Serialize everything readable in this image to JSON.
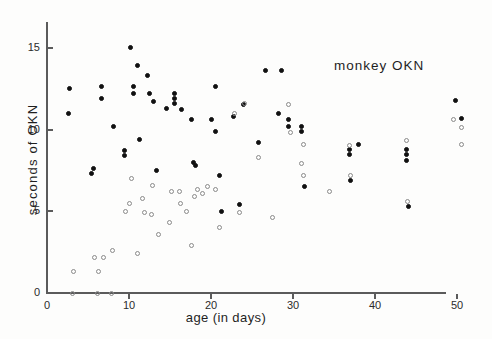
{
  "chart_data": {
    "type": "scatter",
    "title": "monkey OKN",
    "xlabel": "age (in days)",
    "ylabel": "seconds of OKN",
    "xlim": [
      0,
      54
    ],
    "ylim": [
      0,
      16.6
    ],
    "grid": false,
    "legend_position": "none",
    "xticks": [
      0,
      10,
      20,
      30,
      40,
      50
    ],
    "xtick_labels": [
      "0",
      "10",
      "20",
      "30",
      "40",
      "50"
    ],
    "yticks": [
      0,
      5,
      10,
      15
    ],
    "ytick_labels": [
      "0",
      "5",
      "10",
      "15"
    ],
    "series": [
      {
        "name": "filled",
        "marker": "filled-circle",
        "color": "#111111",
        "points": [
          [
            2.7,
            12.5
          ],
          [
            2.6,
            11.0
          ],
          [
            5.4,
            7.3
          ],
          [
            6.6,
            12.6
          ],
          [
            6.6,
            11.9
          ],
          [
            5.7,
            7.6
          ],
          [
            8.1,
            10.2
          ],
          [
            9.5,
            8.7
          ],
          [
            9.5,
            8.4
          ],
          [
            10.2,
            15.0
          ],
          [
            10.5,
            12.6
          ],
          [
            10.5,
            12.2
          ],
          [
            11.3,
            9.4
          ],
          [
            11.0,
            13.9
          ],
          [
            12.3,
            13.3
          ],
          [
            12.5,
            12.2
          ],
          [
            13.0,
            11.7
          ],
          [
            13.4,
            7.5
          ],
          [
            14.6,
            11.3
          ],
          [
            15.6,
            12.2
          ],
          [
            15.6,
            11.9
          ],
          [
            15.6,
            11.6
          ],
          [
            16.4,
            11.2
          ],
          [
            17.6,
            10.6
          ],
          [
            18.1,
            7.8
          ],
          [
            17.9,
            8.0
          ],
          [
            20.5,
            12.6
          ],
          [
            21.0,
            7.2
          ],
          [
            21.3,
            5.0
          ],
          [
            20.0,
            10.6
          ],
          [
            20.5,
            9.9
          ],
          [
            22.8,
            10.8
          ],
          [
            23.5,
            5.4
          ],
          [
            24.0,
            11.5
          ],
          [
            25.8,
            9.2
          ],
          [
            26.6,
            13.6
          ],
          [
            28.6,
            13.6
          ],
          [
            28.2,
            11.0
          ],
          [
            29.5,
            10.6
          ],
          [
            29.5,
            10.2
          ],
          [
            31.0,
            10.2
          ],
          [
            31.0,
            9.9
          ],
          [
            31.4,
            6.5
          ],
          [
            36.9,
            8.8
          ],
          [
            36.9,
            8.5
          ],
          [
            37.0,
            6.9
          ],
          [
            38.0,
            9.1
          ],
          [
            43.9,
            8.8
          ],
          [
            43.9,
            8.5
          ],
          [
            43.9,
            8.1
          ],
          [
            44.1,
            5.3
          ],
          [
            49.8,
            11.8
          ],
          [
            50.6,
            10.7
          ]
        ]
      },
      {
        "name": "open",
        "marker": "open-circle",
        "color": "#8a8a8a",
        "points": [
          [
            3.1,
            0.0
          ],
          [
            3.2,
            1.3
          ],
          [
            6.1,
            0.0
          ],
          [
            6.3,
            1.3
          ],
          [
            7.9,
            0.0
          ],
          [
            5.8,
            2.2
          ],
          [
            6.9,
            2.2
          ],
          [
            8.0,
            2.6
          ],
          [
            9.6,
            5.0
          ],
          [
            10.0,
            5.5
          ],
          [
            10.3,
            7.0
          ],
          [
            11.0,
            2.4
          ],
          [
            11.6,
            5.8
          ],
          [
            11.9,
            4.9
          ],
          [
            12.7,
            4.8
          ],
          [
            12.9,
            6.6
          ],
          [
            13.6,
            3.6
          ],
          [
            14.9,
            4.3
          ],
          [
            15.2,
            6.2
          ],
          [
            16.1,
            6.2
          ],
          [
            16.3,
            5.5
          ],
          [
            17.0,
            5.0
          ],
          [
            17.6,
            2.9
          ],
          [
            18.4,
            6.3
          ],
          [
            18.0,
            5.9
          ],
          [
            19.0,
            6.1
          ],
          [
            19.6,
            6.5
          ],
          [
            20.6,
            6.3
          ],
          [
            21.0,
            4.0
          ],
          [
            23.5,
            4.9
          ],
          [
            22.9,
            11.0
          ],
          [
            24.1,
            11.6
          ],
          [
            25.8,
            8.3
          ],
          [
            27.5,
            4.6
          ],
          [
            29.4,
            11.5
          ],
          [
            29.7,
            9.8
          ],
          [
            31.3,
            9.1
          ],
          [
            31.0,
            7.9
          ],
          [
            31.3,
            7.2
          ],
          [
            34.5,
            6.2
          ],
          [
            36.9,
            9.0
          ],
          [
            37.0,
            7.2
          ],
          [
            43.9,
            9.3
          ],
          [
            44.0,
            5.6
          ],
          [
            49.6,
            10.6
          ],
          [
            50.5,
            9.1
          ],
          [
            50.6,
            10.1
          ]
        ]
      }
    ]
  },
  "axes": {
    "y_title": "seconds of OKN",
    "x_title": "age (in days)"
  },
  "annotation": {
    "text": "monkey OKN"
  },
  "colors": {
    "axis": "#5b5b5b",
    "filled_marker": "#111111",
    "open_marker": "#8a8a8a",
    "text": "#1f1f1f",
    "background": "#fdfdfc"
  }
}
